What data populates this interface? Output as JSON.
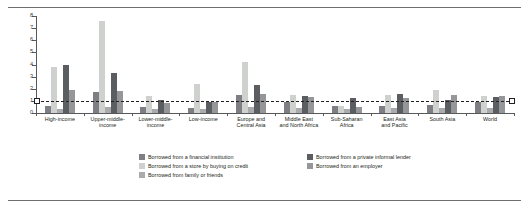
{
  "chart_data": {
    "type": "bar",
    "title": "",
    "xlabel": "",
    "ylabel": "",
    "ylim": [
      0,
      8
    ],
    "yticks": [
      0,
      1,
      2,
      3,
      4,
      5,
      6,
      7,
      8
    ],
    "ytick_labels": [
      "0",
      "1",
      "2",
      "3",
      "4",
      "5",
      "6",
      "7",
      "8"
    ],
    "grid": false,
    "legend_position": "bottom-center",
    "reference_line": {
      "value": 1,
      "style": "dashed",
      "color": "#231f20"
    },
    "categories": [
      "High-income",
      "Upper-middle-income",
      "Lower-middle-income",
      "Low-income",
      "Europe and Central Asia",
      "Middle East and North Africa",
      "Sub-Saharan Africa",
      "East Asia and Pacific",
      "South Asia",
      "World"
    ],
    "category_lines": [
      [
        "High-income"
      ],
      [
        "Upper-middle-",
        "income"
      ],
      [
        "Lower-middle-",
        "income"
      ],
      [
        "Low-income"
      ],
      [
        "Europe and",
        "Central Asia"
      ],
      [
        "Middle East",
        "and North Africa"
      ],
      [
        "Sub-Saharan",
        "Africa"
      ],
      [
        "East Asia",
        "and Pacific"
      ],
      [
        "South Asia"
      ],
      [
        "World"
      ]
    ],
    "series": [
      {
        "name": "Borrowed from a financial institution",
        "color": "#7d7f83",
        "values": [
          0.6,
          1.7,
          0.5,
          0.4,
          1.5,
          0.9,
          0.6,
          0.6,
          0.7,
          0.9
        ]
      },
      {
        "name": "Borrowed from a store by buying on credit",
        "color": "#cfd1ce",
        "values": [
          3.8,
          7.6,
          1.4,
          2.4,
          4.2,
          1.5,
          0.6,
          1.5,
          1.9,
          1.4
        ]
      },
      {
        "name": "Borrowed from family or friends",
        "color": "#a9abae",
        "values": [
          0.3,
          0.5,
          0.3,
          0.3,
          0.5,
          0.4,
          0.3,
          0.4,
          0.4,
          0.4
        ]
      },
      {
        "name": "Borrowed from a private informal lender",
        "color": "#5b5d60",
        "values": [
          4.0,
          3.3,
          1.1,
          0.9,
          2.3,
          1.4,
          1.2,
          1.6,
          1.1,
          1.3
        ]
      },
      {
        "name": "Borrowed from an employer",
        "color": "#94969a",
        "values": [
          1.9,
          1.8,
          0.8,
          0.9,
          1.6,
          1.3,
          0.5,
          1.2,
          1.5,
          1.4
        ]
      }
    ]
  },
  "legend": {
    "items": [
      {
        "label": "Borrowed from a financial institution",
        "swatch": "sw0"
      },
      {
        "label": "Borrowed from a private informal lender",
        "swatch": "sw3"
      },
      {
        "label": "Borrowed from a store by buying on credit",
        "swatch": "sw1"
      },
      {
        "label": "Borrowed from an employer",
        "swatch": "sw4"
      },
      {
        "label": "Borrowed from family or friends",
        "swatch": "sw2"
      }
    ]
  }
}
